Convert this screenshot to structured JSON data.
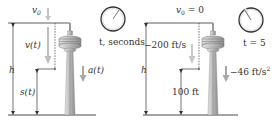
{
  "panels": [
    {
      "id": "general",
      "v0_label": "v",
      "v0_sub": "0",
      "v0_suffix": "",
      "velocity_label": "v(t)",
      "height_label": "h",
      "position_label": "s(t)",
      "acceleration_label": "a(t)",
      "clock_label": "t, seconds"
    },
    {
      "id": "specific",
      "v0_label": "v",
      "v0_sub": "0",
      "v0_suffix": " = 0",
      "velocity_label": "−200 ft/s",
      "height_label": "h",
      "position_label": "100 ft",
      "acceleration_label": "−46 ft/s",
      "acceleration_sup": "2",
      "clock_label": "t = 5"
    }
  ],
  "colors": {
    "line": "#333333",
    "arrow_gray": "#a8a8a8",
    "tower": "#c8c8c8",
    "tower_dark": "#8a8a8a"
  }
}
